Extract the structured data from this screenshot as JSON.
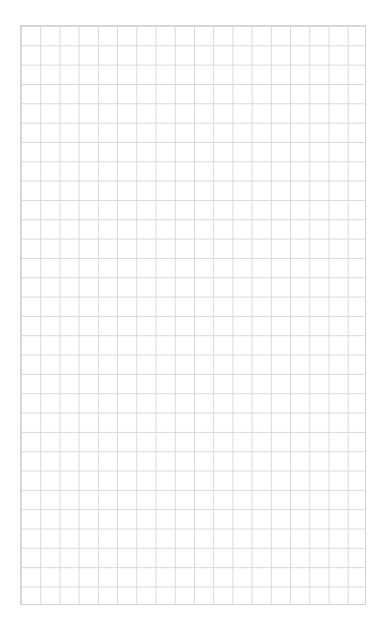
{
  "page": {
    "type": "grid-paper",
    "grid": {
      "columns": 18,
      "rows": 30,
      "line_color": "#d8d8d8",
      "background": "#ffffff"
    }
  }
}
